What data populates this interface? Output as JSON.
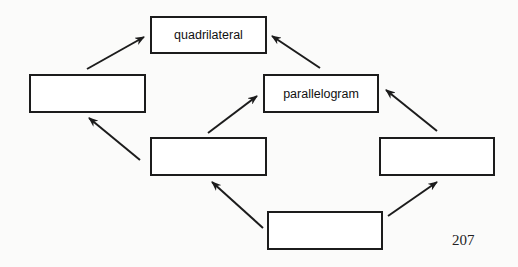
{
  "diagram": {
    "title": "",
    "nodes": [
      {
        "id": "quad",
        "label": "quadrilateral"
      },
      {
        "id": "left",
        "label": ""
      },
      {
        "id": "para",
        "label": "parallelogram"
      },
      {
        "id": "mid",
        "label": ""
      },
      {
        "id": "right",
        "label": ""
      },
      {
        "id": "bot",
        "label": ""
      }
    ],
    "edges": [
      {
        "from": "left",
        "to": "quad"
      },
      {
        "from": "para",
        "to": "quad"
      },
      {
        "from": "mid",
        "to": "left"
      },
      {
        "from": "mid",
        "to": "para"
      },
      {
        "from": "right",
        "to": "para"
      },
      {
        "from": "bot",
        "to": "mid"
      },
      {
        "from": "bot",
        "to": "right"
      }
    ]
  },
  "page_number": "207"
}
